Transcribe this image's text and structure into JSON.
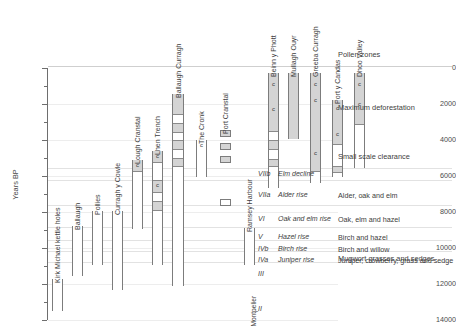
{
  "chart_data": {
    "type": "bar",
    "title": "",
    "ylabel": "Years BP",
    "ylim": [
      0,
      14000
    ],
    "y_inverted": true,
    "grid": true,
    "yticks": [
      0,
      2000,
      4000,
      6000,
      8000,
      10000,
      12000,
      14000
    ],
    "ytick_labels": [
      "0",
      "2000",
      "4000",
      "6000",
      "8000",
      "10000",
      "12000",
      "14000"
    ],
    "minor_ticks": [
      1000,
      3000,
      5000,
      7000,
      9000,
      11000,
      13000
    ],
    "orientation": "vertical-range-bars",
    "xlabel": "",
    "legend_position": "none",
    "sites": [
      {
        "name": "Kirk Michael kettle holes",
        "x_px": 52,
        "width_px": 11,
        "range_bp": [
          11700,
          13500
        ],
        "segments": [
          {
            "from_bp": 11700,
            "to_bp": 13500,
            "fill": "white"
          }
        ],
        "c_marks": []
      },
      {
        "name": "Ballaugh",
        "x_px": 72,
        "width_px": 11,
        "range_bp": [
          8800,
          11550
        ],
        "segments": [
          {
            "from_bp": 8800,
            "to_bp": 11550,
            "fill": "white"
          }
        ],
        "c_marks": []
      },
      {
        "name": "Pollies",
        "x_px": 92,
        "width_px": 11,
        "range_bp": [
          7950,
          10950
        ],
        "segments": [
          {
            "from_bp": 7950,
            "to_bp": 10950,
            "fill": "white"
          }
        ],
        "c_marks": []
      },
      {
        "name": "Curragh y Cowle",
        "x_px": 112,
        "width_px": 11,
        "range_bp": [
          7950,
          12350
        ],
        "segments": [
          {
            "from_bp": 7950,
            "to_bp": 12350,
            "fill": "white"
          }
        ],
        "c_marks": []
      },
      {
        "name": "Lough Cranstal",
        "x_px": 132,
        "width_px": 11,
        "range_bp": [
          5100,
          8950
        ],
        "segments": [
          {
            "from_bp": 5100,
            "to_bp": 5700,
            "fill": "grey"
          },
          {
            "from_bp": 5700,
            "to_bp": 8950,
            "fill": "white"
          }
        ],
        "c_marks": [
          5400
        ]
      },
      {
        "name": "Lhen Trench",
        "x_px": 152,
        "width_px": 11,
        "range_bp": [
          4600,
          10950
        ],
        "segments": [
          {
            "from_bp": 4600,
            "to_bp": 5250,
            "fill": "grey"
          },
          {
            "from_bp": 5250,
            "to_bp": 6200,
            "fill": "white"
          },
          {
            "from_bp": 6200,
            "to_bp": 6900,
            "fill": "grey"
          },
          {
            "from_bp": 6900,
            "to_bp": 7400,
            "fill": "white"
          },
          {
            "from_bp": 7400,
            "to_bp": 7900,
            "fill": "grey"
          },
          {
            "from_bp": 7900,
            "to_bp": 10950,
            "fill": "white"
          }
        ],
        "c_marks": [
          4880,
          6520
        ]
      },
      {
        "name": "Ballaugh Curragh",
        "x_px": 172,
        "width_px": 12,
        "range_bp": [
          1450,
          12100
        ],
        "segments": [
          {
            "from_bp": 1450,
            "to_bp": 2550,
            "fill": "grey"
          },
          {
            "from_bp": 2550,
            "to_bp": 3050,
            "fill": "white"
          },
          {
            "from_bp": 3050,
            "to_bp": 3550,
            "fill": "grey"
          },
          {
            "from_bp": 3550,
            "to_bp": 4000,
            "fill": "white"
          },
          {
            "from_bp": 4000,
            "to_bp": 4500,
            "fill": "grey"
          },
          {
            "from_bp": 4500,
            "to_bp": 5000,
            "fill": "white"
          },
          {
            "from_bp": 5000,
            "to_bp": 5450,
            "fill": "grey"
          },
          {
            "from_bp": 5450,
            "to_bp": 12100,
            "fill": "white"
          }
        ],
        "c_marks": []
      },
      {
        "name": "The Cronk",
        "x_px": 196,
        "width_px": 11,
        "range_bp": [
          4000,
          6050
        ],
        "segments": [
          {
            "from_bp": 4000,
            "to_bp": 6050,
            "fill": "white"
          }
        ],
        "c_marks": [
          4250
        ]
      },
      {
        "name": "Port Cranstal",
        "x_px": 220,
        "width_px": 11,
        "range_bp": [
          3450,
          7650
        ],
        "segments": [
          {
            "from_bp": 3450,
            "to_bp": 3850,
            "fill": "grey"
          },
          {
            "from_bp": 4150,
            "to_bp": 4550,
            "fill": "grey"
          },
          {
            "from_bp": 4900,
            "to_bp": 5300,
            "fill": "grey"
          },
          {
            "from_bp": 7250,
            "to_bp": 7650,
            "fill": "white"
          }
        ],
        "c_marks": []
      },
      {
        "name": "Ramsey Harbour",
        "x_px": 244,
        "width_px": 11,
        "range_bp": [
          8900,
          10950
        ],
        "segments": [
          {
            "from_bp": 8900,
            "to_bp": 10950,
            "fill": "white"
          }
        ],
        "c_marks": []
      },
      {
        "name": "Beinn y Phott",
        "x_px": 268,
        "width_px": 11,
        "range_bp": [
          250,
          6650
        ],
        "segments": [
          {
            "from_bp": 250,
            "to_bp": 3500,
            "fill": "grey"
          },
          {
            "from_bp": 3500,
            "to_bp": 4000,
            "fill": "white"
          },
          {
            "from_bp": 4000,
            "to_bp": 4500,
            "fill": "grey"
          },
          {
            "from_bp": 4500,
            "to_bp": 5050,
            "fill": "white"
          },
          {
            "from_bp": 5050,
            "to_bp": 5450,
            "fill": "grey"
          },
          {
            "from_bp": 5450,
            "to_bp": 6650,
            "fill": "white"
          }
        ],
        "c_marks": [
          900,
          2250
        ]
      },
      {
        "name": "Mullagh Ouyr",
        "x_px": 288,
        "width_px": 11,
        "range_bp": [
          250,
          3950
        ],
        "segments": [
          {
            "from_bp": 250,
            "to_bp": 3950,
            "fill": "grey"
          }
        ],
        "c_marks": []
      },
      {
        "name": "Greeba Curragh",
        "x_px": 310,
        "width_px": 11,
        "range_bp": [
          250,
          6400
        ],
        "segments": [
          {
            "from_bp": 250,
            "to_bp": 5700,
            "fill": "grey"
          },
          {
            "from_bp": 5700,
            "to_bp": 6400,
            "fill": "white"
          }
        ],
        "c_marks": [
          900,
          1750,
          4700
        ]
      },
      {
        "name": "Port y Candas",
        "x_px": 332,
        "width_px": 11,
        "range_bp": [
          1800,
          6050
        ],
        "segments": [
          {
            "from_bp": 1800,
            "to_bp": 4200,
            "fill": "grey"
          },
          {
            "from_bp": 4200,
            "to_bp": 5450,
            "fill": "white"
          },
          {
            "from_bp": 5450,
            "to_bp": 5800,
            "fill": "grey"
          },
          {
            "from_bp": 5800,
            "to_bp": 6050,
            "fill": "white"
          }
        ],
        "c_marks": [
          2200,
          3650
        ]
      },
      {
        "name": "Dhoo Valley",
        "x_px": 354,
        "width_px": 11,
        "range_bp": [
          250,
          5550
        ],
        "segments": [
          {
            "from_bp": 250,
            "to_bp": 3100,
            "fill": "grey"
          },
          {
            "from_bp": 3100,
            "to_bp": 5550,
            "fill": "white"
          }
        ],
        "c_marks": [
          900,
          2000
        ]
      }
    ],
    "side_labels": [
      {
        "text": "Montpelier",
        "x_px": 258,
        "bottom_px": 320
      }
    ],
    "column_headers": {
      "pollen_zones": "Pollen zones"
    },
    "phases": [
      {
        "label": "Maximum deforestation",
        "y_px": 103
      },
      {
        "label": "Small scale clearance",
        "y_px": 152
      },
      {
        "label": "Mugwort grasses and sedges",
        "y_px": 254
      }
    ],
    "zones": [
      {
        "code": "VIIb",
        "name": "Elm decline",
        "vegetation": "",
        "y_px": 170
      },
      {
        "code": "VIIa",
        "name": "Alder rise",
        "vegetation": "Alder, oak and elm",
        "y_px": 191
      },
      {
        "code": "VI",
        "name": "Oak and elm rise",
        "vegetation": "Oak, elm and hazel",
        "y_px": 215
      },
      {
        "code": "V",
        "name": "Hazel rise",
        "vegetation": "Birch and hazel",
        "y_px": 233
      },
      {
        "code": "IVb",
        "name": "Birch rise",
        "vegetation": "Birch and willow",
        "y_px": 245
      },
      {
        "code": "IVa",
        "name": "Juniper rise",
        "vegetation": "Juniper, crowberry, grass and sedge",
        "y_px": 256
      },
      {
        "code": "III",
        "name": "",
        "vegetation": "",
        "y_px": 270
      },
      {
        "code": "II",
        "name": "",
        "vegetation": "",
        "y_px": 305
      }
    ],
    "zone_boundary_rules_y_px": [
      66,
      168,
      180,
      205,
      227,
      240,
      251,
      262
    ],
    "colors": {
      "bar_fill_grey": "#d4d4d4",
      "bar_fill_white": "#ffffff",
      "bar_stroke": "#7c7c7c",
      "gridline": "#ededed",
      "text": "#3d3d3d",
      "axis": "#6e6e6e"
    },
    "c_mark_label": "c"
  }
}
